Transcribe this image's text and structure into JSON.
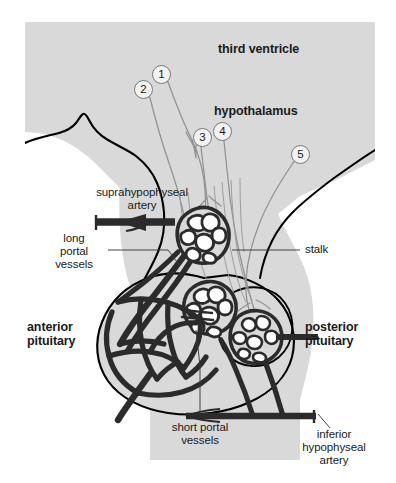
{
  "figure": {
    "background_color": "#ffffff",
    "tissue_fill": "#d9d9d9",
    "vessel_color": "#2b2b2b",
    "outline_color": "#000000",
    "neuron_color": "#8c8c8c"
  },
  "labels": {
    "third_ventricle": "third ventricle",
    "hypothalamus": "hypothalamus",
    "suprahypophyseal_artery": "suprahypophyseal\nartery",
    "long_portal_vessels": "long\nportal\nvessels",
    "stalk": "stalk",
    "anterior_pituitary": "anterior\npituitary",
    "posterior_pituitary": "posterior\npituitary",
    "short_portal_vessels": "short portal\nvessels",
    "inferior_hypophyseal_artery": "inferior\nhypophyseal\nartery"
  },
  "callouts": [
    {
      "id": "1",
      "label": "1",
      "cx": 161,
      "cy": 74
    },
    {
      "id": "2",
      "label": "2",
      "cx": 143,
      "cy": 89
    },
    {
      "id": "3",
      "label": "3",
      "cx": 202,
      "cy": 137
    },
    {
      "id": "4",
      "label": "4",
      "cx": 222,
      "cy": 131
    },
    {
      "id": "5",
      "label": "5",
      "cx": 300,
      "cy": 154
    }
  ]
}
